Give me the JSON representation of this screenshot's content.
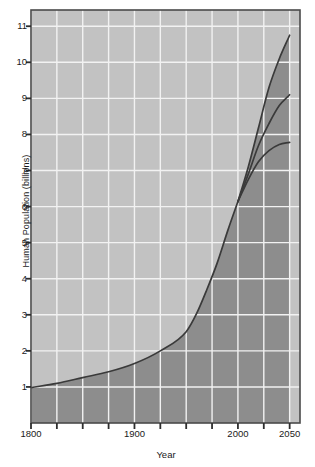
{
  "chart_data": {
    "type": "line",
    "title": "",
    "xlabel": "Year",
    "ylabel": "Human Population (billions)",
    "xlim": [
      1800,
      2060
    ],
    "ylim": [
      0.0,
      11.45
    ],
    "grid": true,
    "legend_position": "none",
    "y_ticks": [
      1,
      2,
      3,
      4,
      5,
      6,
      7,
      8,
      9,
      10,
      11
    ],
    "y_tick_labels": [
      "1",
      "2",
      "3",
      "4",
      "5",
      "6",
      "7",
      "8",
      "9",
      "10",
      "11"
    ],
    "x_ticks": [
      1800,
      1825,
      1850,
      1875,
      1900,
      1925,
      1950,
      1975,
      2000,
      2025,
      2050
    ],
    "x_tick_labels_shown": [
      "1800",
      "1900",
      "2000",
      "2050"
    ],
    "x_tick_label_values": [
      1800,
      1900,
      2000,
      2050
    ],
    "annotations": [],
    "shaded_area_note": "Area beneath the historical population curve is filled a darker grey than the plot background",
    "series": [
      {
        "name": "historical",
        "x": [
          1800,
          1825,
          1850,
          1875,
          1900,
          1925,
          1950,
          1960,
          1970,
          1980,
          1990,
          2000
        ],
        "values": [
          0.98,
          1.1,
          1.26,
          1.42,
          1.65,
          2.0,
          2.53,
          3.03,
          3.7,
          4.44,
          5.32,
          6.14
        ]
      },
      {
        "name": "high-projection",
        "x": [
          2000,
          2010,
          2020,
          2030,
          2040,
          2050
        ],
        "values": [
          6.14,
          7.1,
          8.2,
          9.3,
          10.1,
          10.75
        ]
      },
      {
        "name": "medium-projection",
        "x": [
          2000,
          2010,
          2020,
          2030,
          2040,
          2050
        ],
        "values": [
          6.14,
          6.9,
          7.7,
          8.3,
          8.8,
          9.1
        ]
      },
      {
        "name": "low-projection",
        "x": [
          2000,
          2010,
          2020,
          2030,
          2040,
          2050
        ],
        "values": [
          6.14,
          6.75,
          7.25,
          7.55,
          7.72,
          7.78
        ]
      }
    ]
  },
  "colors": {
    "plot_background": "#c2c2c2",
    "shaded_background": "#8d8d8d",
    "gridline": "#f2f2f2",
    "curve": "#3a3a3a",
    "axis": "#4a4a4a",
    "text": "#1a1a1a",
    "page_background": "#ffffff"
  }
}
